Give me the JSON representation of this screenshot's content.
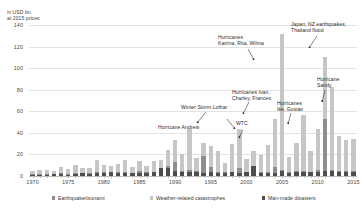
{
  "axis_caption": "in USD bn.\nat 2015 prices",
  "legend": [
    {
      "label": "Earthquake/tsunami",
      "color": "#8e8e8e",
      "left": 52
    },
    {
      "label": "Weather-related catastrophes",
      "color": "#c6c6c6",
      "left": 150
    },
    {
      "label": "Man-made disasters",
      "color": "#4d4d4d",
      "left": 262
    }
  ],
  "annotations": [
    {
      "id": "katrina",
      "text": "Hurricanes\nKatrina, Rita, Wilma",
      "left": 218,
      "top": 34
    },
    {
      "id": "japan",
      "text": "Japan, NZ earthquakes,\nThailand flood",
      "left": 291,
      "top": 21
    },
    {
      "id": "sandy",
      "text": "Hurricane\nSandy",
      "left": 317,
      "top": 76
    },
    {
      "id": "ivan",
      "text": "Hurricanes Ivan,\nCharley, Frances",
      "left": 232,
      "top": 89
    },
    {
      "id": "ike",
      "text": "Hurricanes\nIke, Gustav",
      "left": 277,
      "top": 100
    },
    {
      "id": "lothar",
      "text": "Winter Storm Lothar",
      "left": 181,
      "top": 104
    },
    {
      "id": "wtc",
      "text": "WTC",
      "left": 236,
      "top": 120
    },
    {
      "id": "andrew",
      "text": "Hurricane Andrew",
      "left": 158,
      "top": 124
    }
  ],
  "chart_data": {
    "type": "bar",
    "stacked": true,
    "title": "",
    "subtitle": "",
    "xlabel": "",
    "ylabel": "in USD bn. at 2015 prices",
    "ylim": [
      0,
      140
    ],
    "yticks": [
      0,
      20,
      40,
      60,
      80,
      100,
      120,
      140
    ],
    "grid": true,
    "legend_position": "bottom",
    "xticks": [
      1970,
      1975,
      1980,
      1985,
      1990,
      1995,
      2000,
      2005,
      2010,
      2015
    ],
    "categories": [
      1970,
      1971,
      1972,
      1973,
      1974,
      1975,
      1976,
      1977,
      1978,
      1979,
      1980,
      1981,
      1982,
      1983,
      1984,
      1985,
      1986,
      1987,
      1988,
      1989,
      1990,
      1991,
      1992,
      1993,
      1994,
      1995,
      1996,
      1997,
      1998,
      1999,
      2000,
      2001,
      2002,
      2003,
      2004,
      2005,
      2006,
      2007,
      2008,
      2009,
      2010,
      2011,
      2012,
      2013,
      2014,
      2015
    ],
    "series": [
      {
        "name": "Man-made disasters",
        "color": "#4d4d4d",
        "values": [
          1.0,
          1.0,
          1.0,
          1.5,
          2.0,
          1.0,
          1.5,
          2.5,
          2.0,
          3.0,
          2.5,
          3.5,
          3.0,
          3.0,
          2.5,
          3.0,
          3.0,
          3.5,
          7.0,
          7.0,
          5.0,
          4.0,
          3.5,
          3.5,
          3.0,
          4.0,
          3.0,
          3.0,
          3.5,
          3.0,
          3.5,
          9.0,
          3.0,
          3.0,
          3.0,
          5.0,
          3.0,
          4.0,
          4.0,
          3.5,
          4.0,
          5.0,
          5.0,
          4.0,
          4.0,
          4.0
        ]
      },
      {
        "name": "Earthquake/tsunami",
        "color": "#8e8e8e",
        "values": [
          0.5,
          0.5,
          1.0,
          0.5,
          0.5,
          0.5,
          1.5,
          0.5,
          1.0,
          0.5,
          1.0,
          0.5,
          0.5,
          0.5,
          0.5,
          1.5,
          0.5,
          0.5,
          0.5,
          2.0,
          8.0,
          1.0,
          2.0,
          1.0,
          16.0,
          4.0,
          0.5,
          0.5,
          0.5,
          4.0,
          0.5,
          0.5,
          0.5,
          1.0,
          5.0,
          0.5,
          0.5,
          0.5,
          1.0,
          0.5,
          2.0,
          48.0,
          0.5,
          0.5,
          0.5,
          0.5
        ]
      },
      {
        "name": "Weather-related catastrophes",
        "color": "#c6c6c6",
        "values": [
          3.5,
          4.0,
          4.0,
          2.5,
          6.0,
          5.0,
          7.0,
          4.0,
          4.5,
          11.0,
          7.0,
          5.5,
          8.0,
          11.5,
          5.0,
          9.0,
          5.5,
          10.0,
          7.0,
          15.0,
          20.0,
          15.0,
          38.0,
          12.0,
          12.0,
          20.0,
          20.0,
          9.0,
          26.0,
          37.0,
          12.0,
          14.0,
          16.0,
          25.0,
          45.0,
          126.0,
          14.0,
          26.0,
          52.0,
          19.0,
          38.0,
          57.0,
          77.0,
          33.0,
          29.0,
          30.0
        ]
      }
    ]
  }
}
